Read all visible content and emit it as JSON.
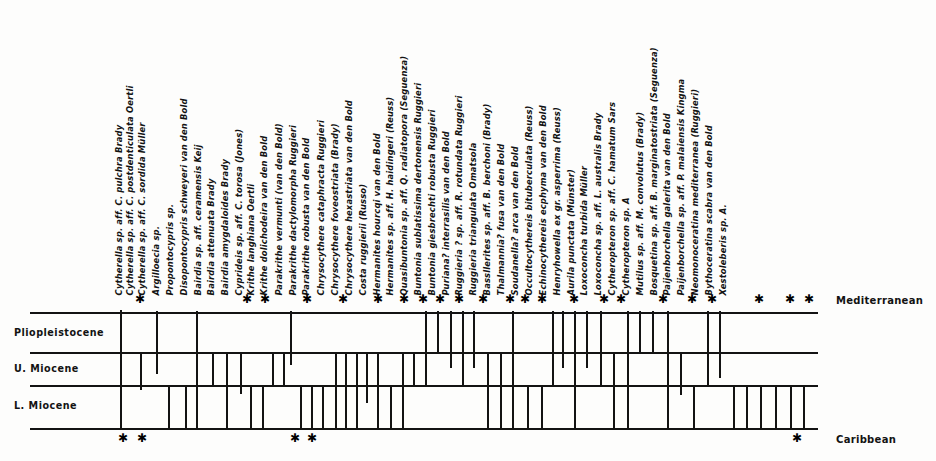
{
  "figure": {
    "type": "range-chart",
    "regions": {
      "top_label": "Mediterranean",
      "bottom_label": "Caribbean"
    },
    "epochs": [
      {
        "label": "Pliopleistocene"
      },
      {
        "label": "U. Miocene"
      },
      {
        "label": "L. Miocene"
      }
    ]
  },
  "chart_data": {
    "type": "bar",
    "title": "",
    "xlabel": "",
    "ylabel": "",
    "grid": true,
    "legend_position": "none",
    "axis_rows": [
      "Pliopleistocene",
      "U. Miocene",
      "L. Miocene"
    ],
    "row_boundaries_px": [
      312,
      352,
      385,
      428
    ],
    "plot_left_px": 110,
    "plot_right_px": 818,
    "categories": [
      "Cytherella sp. aff. C. pulchra Brady",
      "Cytherella sp. aff. C. postdenticulata Oertli",
      "Cytherella sp. aff. C. sordida Müller",
      "Argilloecia sp.",
      "Propontocypris sp.",
      "Disopontocypris schweyeri van den Bold",
      "Bairdia sp. aff. ceramensis Keij",
      "Bairdia attenuata Brady",
      "Bairdia amygdaloides Brady",
      "Cyprideis sp. aff. C. torosa (Jones)",
      "Krithe langhiana Oertli",
      "Krithe dolichodeira van den Bold",
      "Parakrithe vermunti (van den Bold)",
      "Parakrithe dactylomorpha Ruggieri",
      "Parakrithe robusta van den Bold",
      "Chrysocythere cataphracta Ruggieri",
      "Chrysocythere foveostriata (Brady)",
      "Chrysocythere hexastriata van den Bold",
      "Costa ruggierii (Russo)",
      "Hermanites hourcqi van den Bold",
      "Hermanites sp. aff. H. haidingeri (Reuss)",
      "Quasibuntonia sp. aff. Q. radiatopora (Seguenza)",
      "Buntonia sublatissima dertonensis Ruggieri",
      "Buntonia giesbrechti robusta Ruggieri",
      "Puriana? interrasilis van den Bold",
      "Ruggieria ? sp. aff. R. rotundata Ruggieri",
      "Ruggieria triangulata Omatsola",
      "Bassllerites sp. aff. B. berchoni (Brady)",
      "Thalmannia? fusa van den Bold",
      "Soudanella? arca van den Bold",
      "Occultocythereis bituberculata (Reuss)",
      "Echinocythereis ecphyma van den Bold",
      "Henryhowella ex gr. asperrima (Reuss)",
      "Aurila punctata (Münster)",
      "Loxoconcha turbida Müller",
      "Loxoconcha sp. aff. L. australis Brady",
      "Cytheropteron sp. aff. C. hamatum Sars",
      "Cytheropteron sp. A",
      "Mutilus sp. aff. M. convolutus (Brady)",
      "Bosquetina sp. aff. B. marginatostriata (Seguenza)",
      "Paijenborchella galerita van den Bold",
      "Paijenborchella sp. aff. P. malaiensis Kingma",
      "Neomonoceratina mediterranea (Ruggieri)",
      "Bythoceratina scabra van den Bold",
      "Xestoleberis sp. A."
    ],
    "label_x_px": [
      120,
      131,
      143,
      157,
      171,
      185,
      199,
      212,
      226,
      240,
      252,
      265,
      280,
      294,
      307,
      322,
      336,
      350,
      364,
      378,
      391,
      405,
      419,
      433,
      447,
      460,
      474,
      488,
      502,
      516,
      530,
      544,
      558,
      572,
      585,
      599,
      613,
      627,
      641,
      655,
      668,
      682,
      696,
      710,
      724
    ],
    "series": [
      {
        "name": "Mediterranean ranges",
        "segments_px": [
          {
            "x": 120,
            "y1": 310,
            "y2": 428
          },
          {
            "x": 140,
            "y1": 352,
            "y2": 390
          },
          {
            "x": 156,
            "y1": 311,
            "y2": 374
          },
          {
            "x": 168,
            "y1": 385,
            "y2": 428
          },
          {
            "x": 185,
            "y1": 385,
            "y2": 428
          },
          {
            "x": 196,
            "y1": 311,
            "y2": 428
          },
          {
            "x": 212,
            "y1": 352,
            "y2": 385
          },
          {
            "x": 226,
            "y1": 352,
            "y2": 428
          },
          {
            "x": 240,
            "y1": 352,
            "y2": 394
          },
          {
            "x": 250,
            "y1": 385,
            "y2": 428
          },
          {
            "x": 262,
            "y1": 385,
            "y2": 428
          },
          {
            "x": 272,
            "y1": 352,
            "y2": 387
          },
          {
            "x": 283,
            "y1": 352,
            "y2": 385
          },
          {
            "x": 290,
            "y1": 311,
            "y2": 365
          },
          {
            "x": 300,
            "y1": 385,
            "y2": 428
          },
          {
            "x": 311,
            "y1": 385,
            "y2": 428
          },
          {
            "x": 322,
            "y1": 385,
            "y2": 428
          },
          {
            "x": 335,
            "y1": 352,
            "y2": 428
          },
          {
            "x": 345,
            "y1": 352,
            "y2": 428
          },
          {
            "x": 356,
            "y1": 352,
            "y2": 428
          },
          {
            "x": 366,
            "y1": 352,
            "y2": 403
          },
          {
            "x": 377,
            "y1": 352,
            "y2": 428
          },
          {
            "x": 390,
            "y1": 385,
            "y2": 428
          },
          {
            "x": 402,
            "y1": 352,
            "y2": 428
          },
          {
            "x": 413,
            "y1": 352,
            "y2": 385
          },
          {
            "x": 425,
            "y1": 311,
            "y2": 385
          },
          {
            "x": 437,
            "y1": 311,
            "y2": 352
          },
          {
            "x": 450,
            "y1": 311,
            "y2": 368
          },
          {
            "x": 462,
            "y1": 311,
            "y2": 385
          },
          {
            "x": 473,
            "y1": 311,
            "y2": 368
          },
          {
            "x": 487,
            "y1": 352,
            "y2": 428
          },
          {
            "x": 500,
            "y1": 352,
            "y2": 428
          },
          {
            "x": 512,
            "y1": 311,
            "y2": 428
          },
          {
            "x": 527,
            "y1": 385,
            "y2": 428
          },
          {
            "x": 541,
            "y1": 385,
            "y2": 428
          },
          {
            "x": 552,
            "y1": 311,
            "y2": 385
          },
          {
            "x": 562,
            "y1": 311,
            "y2": 368
          },
          {
            "x": 574,
            "y1": 311,
            "y2": 428
          },
          {
            "x": 586,
            "y1": 311,
            "y2": 368
          },
          {
            "x": 600,
            "y1": 311,
            "y2": 385
          },
          {
            "x": 613,
            "y1": 352,
            "y2": 428
          },
          {
            "x": 627,
            "y1": 311,
            "y2": 428
          },
          {
            "x": 639,
            "y1": 311,
            "y2": 352
          },
          {
            "x": 652,
            "y1": 311,
            "y2": 352
          },
          {
            "x": 667,
            "y1": 311,
            "y2": 428
          },
          {
            "x": 680,
            "y1": 352,
            "y2": 395
          },
          {
            "x": 693,
            "y1": 385,
            "y2": 428
          },
          {
            "x": 707,
            "y1": 311,
            "y2": 385
          },
          {
            "x": 719,
            "y1": 311,
            "y2": 378
          },
          {
            "x": 733,
            "y1": 385,
            "y2": 428
          },
          {
            "x": 746,
            "y1": 385,
            "y2": 428
          },
          {
            "x": 760,
            "y1": 385,
            "y2": 428
          },
          {
            "x": 775,
            "y1": 385,
            "y2": 428
          },
          {
            "x": 790,
            "y1": 385,
            "y2": 428
          },
          {
            "x": 803,
            "y1": 385,
            "y2": 428
          }
        ]
      }
    ],
    "asterisks_top_px": [
      140,
      247,
      265,
      307,
      343,
      378,
      404,
      423,
      440,
      459,
      483,
      510,
      525,
      542,
      574,
      604,
      621,
      663,
      692,
      712,
      759,
      790,
      809
    ],
    "asterisks_bottom_px": [
      123,
      142,
      295,
      312,
      797
    ]
  }
}
